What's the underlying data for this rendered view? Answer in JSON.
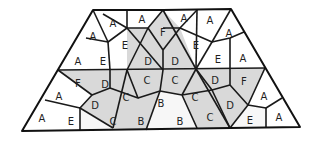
{
  "diagram": {
    "colors": {
      "light": "#f7f7f7",
      "shaded": "#d9d9d9",
      "stroke": "#1a1a1a"
    },
    "cells": [
      {
        "label": "A",
        "shade": "light",
        "points": "93,10 127,11 108,42 86,38"
      },
      {
        "label": "A",
        "shade": "light",
        "points": "127,11 127,28 110,32 108,42 127,11"
      },
      {
        "label": "A",
        "shade": "light",
        "points": "127,11 163,10 148,28 127,28"
      },
      {
        "label": "A",
        "shade": "light",
        "points": "163,10 197,10 180,28 163,28 148,28"
      },
      {
        "label": "A",
        "shade": "light",
        "points": "197,10 231,9 244,32 230,38 212,42"
      },
      {
        "label": "A",
        "shade": "light",
        "points": "244,32 265,68 230,68 230,48 230,38"
      },
      {
        "label": "A",
        "shade": "light",
        "points": "86,38 108,42 110,70 58,70"
      },
      {
        "label": "E",
        "shade": "light",
        "points": "108,42 127,28 148,28 127,70 110,70"
      },
      {
        "label": "E",
        "shade": "light",
        "points": "127,28 148,28 163,28 163,50 127,70"
      },
      {
        "label": "F",
        "shade": "shaded",
        "points": "163,10 180,28 163,50 148,28"
      },
      {
        "label": "E",
        "shade": "light",
        "points": "180,28 197,10 212,42 196,69"
      },
      {
        "label": "E",
        "shade": "light",
        "points": "212,42 230,38 230,48 230,68 196,69"
      },
      {
        "label": "D",
        "shade": "shaded",
        "points": "127,28 148,28 163,50 127,70"
      },
      {
        "label": "D",
        "shade": "shaded",
        "points": "163,50 180,28 196,69 163,70"
      },
      {
        "label": "F",
        "shade": "shaded",
        "points": "58,70 110,70 110,88 92,95"
      },
      {
        "label": "D",
        "shade": "shaded",
        "points": "110,70 127,70 138,98 110,88"
      },
      {
        "label": "C",
        "shade": "shaded",
        "points": "127,70 163,70 163,88 138,98"
      },
      {
        "label": "C",
        "shade": "shaded",
        "points": "163,70 196,69 182,95 163,88"
      },
      {
        "label": "D",
        "shade": "shaded",
        "points": "196,69 230,68 230,85 212,90 182,95"
      },
      {
        "label": "F",
        "shade": "shaded",
        "points": "230,68 265,68 248,105 230,85"
      },
      {
        "label": "A",
        "shade": "light",
        "points": "58,70 92,95 80,108 45,100"
      },
      {
        "label": "C",
        "shade": "shaded",
        "points": "127,70 138,98 160,91 163,88"
      },
      {
        "label": "D",
        "shade": "shaded",
        "points": "92,95 110,88 138,98 113,128 80,108"
      },
      {
        "label": "C",
        "shade": "shaded",
        "points": "138,98 160,91 146,130 113,128"
      },
      {
        "label": "B",
        "shade": "light",
        "points": "160,91 182,95 177,104 175,130 146,130"
      },
      {
        "label": "B",
        "shade": "light",
        "points": "163,88 182,95 160,91"
      },
      {
        "label": "C",
        "shade": "shaded",
        "points": "182,95 212,90 230,128 197,128"
      },
      {
        "label": "D",
        "shade": "shaded",
        "points": "212,90 230,85 248,105 230,128"
      },
      {
        "label": "A",
        "shade": "light",
        "points": "248,105 265,68 282,98 266,108"
      },
      {
        "label": "A",
        "shade": "light",
        "points": "22,131 45,100 80,108 80,131"
      },
      {
        "label": "E",
        "shade": "light",
        "points": "80,108 113,128 113,131 80,131"
      },
      {
        "label": "E",
        "shade": "light",
        "points": "230,128 248,105 266,108 266,128"
      },
      {
        "label": "A",
        "shade": "light",
        "points": "266,108 282,98 300,127 266,128"
      }
    ],
    "labels": [
      {
        "text": "A",
        "x": 113,
        "y": 23
      },
      {
        "text": "A",
        "x": 142,
        "y": 19
      },
      {
        "text": "F",
        "x": 163,
        "y": 32
      },
      {
        "text": "A",
        "x": 184,
        "y": 18
      },
      {
        "text": "A",
        "x": 210,
        "y": 20
      },
      {
        "text": "A",
        "x": 93,
        "y": 36
      },
      {
        "text": "E",
        "x": 125,
        "y": 45
      },
      {
        "text": "D",
        "x": 148,
        "y": 61
      },
      {
        "text": "D",
        "x": 175,
        "y": 61
      },
      {
        "text": "E",
        "x": 196,
        "y": 45
      },
      {
        "text": "A",
        "x": 229,
        "y": 33
      },
      {
        "text": "A",
        "x": 78,
        "y": 61
      },
      {
        "text": "E",
        "x": 103,
        "y": 61
      },
      {
        "text": "E",
        "x": 218,
        "y": 59
      },
      {
        "text": "A",
        "x": 243,
        "y": 58
      },
      {
        "text": "F",
        "x": 78,
        "y": 83
      },
      {
        "text": "D",
        "x": 105,
        "y": 84
      },
      {
        "text": "C",
        "x": 147,
        "y": 80
      },
      {
        "text": "C",
        "x": 175,
        "y": 80
      },
      {
        "text": "D",
        "x": 215,
        "y": 80
      },
      {
        "text": "F",
        "x": 244,
        "y": 81
      },
      {
        "text": "A",
        "x": 59,
        "y": 96
      },
      {
        "text": "C",
        "x": 126,
        "y": 97
      },
      {
        "text": "B",
        "x": 161,
        "y": 103
      },
      {
        "text": "C",
        "x": 195,
        "y": 97
      },
      {
        "text": "A",
        "x": 264,
        "y": 96
      },
      {
        "text": "D",
        "x": 95,
        "y": 105
      },
      {
        "text": "D",
        "x": 230,
        "y": 105
      },
      {
        "text": "A",
        "x": 42,
        "y": 118
      },
      {
        "text": "E",
        "x": 71,
        "y": 121
      },
      {
        "text": "C",
        "x": 113,
        "y": 121
      },
      {
        "text": "B",
        "x": 141,
        "y": 121
      },
      {
        "text": "B",
        "x": 180,
        "y": 121
      },
      {
        "text": "C",
        "x": 210,
        "y": 117
      },
      {
        "text": "E",
        "x": 250,
        "y": 120
      },
      {
        "text": "A",
        "x": 279,
        "y": 117
      }
    ]
  }
}
